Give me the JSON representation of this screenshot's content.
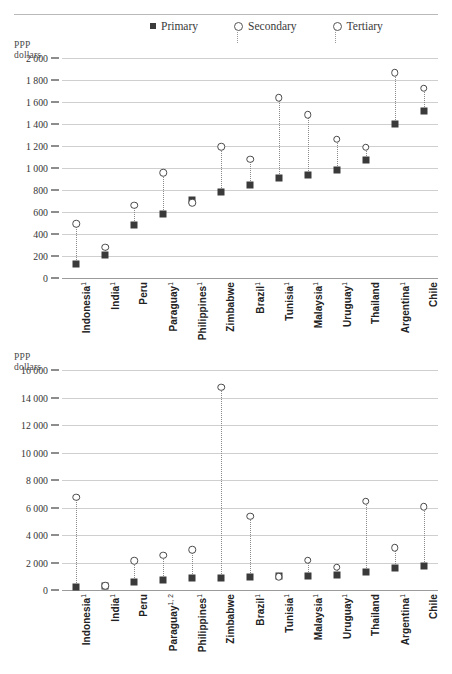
{
  "legend": {
    "items": [
      {
        "label": "Primary",
        "marker": "filled-square",
        "color": "#3c3c3c"
      },
      {
        "label": "Secondary",
        "marker": "open-circle",
        "color": "#555555"
      },
      {
        "label": "Tertiary",
        "marker": "open-circle",
        "color": "#555555"
      }
    ]
  },
  "chart_data": [
    {
      "id": "top",
      "type": "scatter",
      "title": "",
      "ylabel": "PPP dollars",
      "xlabel": "",
      "ylim": [
        0,
        2000
      ],
      "ytick_step": 200,
      "ytick_labels": [
        "0",
        "200",
        "400",
        "600",
        "800",
        "1 000",
        "1 200",
        "1 400",
        "1 600",
        "1 800",
        "2 000"
      ],
      "grid": true,
      "legend_position": "top-center",
      "categories": [
        "Indonesia¹",
        "India¹",
        "Peru",
        "Paraguay¹",
        "Philippines¹",
        "Zimbabwe",
        "Brazil¹",
        "Tunisia¹",
        "Malaysia¹",
        "Uruguay¹",
        "Thailand",
        "Argentina¹",
        "Chile"
      ],
      "series": [
        {
          "name": "Primary",
          "marker": "filled-square",
          "values": [
            130,
            210,
            480,
            580,
            710,
            780,
            845,
            905,
            940,
            985,
            1070,
            1400,
            1520
          ]
        },
        {
          "name": "Secondary",
          "marker": "open-circle",
          "values": [
            500,
            285,
            665,
            960,
            690,
            1200,
            1085,
            1645,
            1490,
            1265,
            1195,
            1870,
            1730
          ]
        }
      ]
    },
    {
      "id": "bottom",
      "type": "scatter",
      "title": "",
      "ylabel": "PPP dollars",
      "xlabel": "",
      "ylim": [
        0,
        16000
      ],
      "ytick_step": 2000,
      "ytick_labels": [
        "0",
        "2 000",
        "4 000",
        "6 000",
        "8 000",
        "10 000",
        "12 000",
        "14 000",
        "16 000"
      ],
      "grid": true,
      "legend_position": "none",
      "categories": [
        "Indonesia¹",
        "India¹",
        "Peru",
        "Paraguay¹'²",
        "Philippines¹",
        "Zimbabwe",
        "Brazil¹",
        "Tunisia¹",
        "Malaysia¹",
        "Uruguay¹",
        "Thailand",
        "Argentina¹",
        "Chile"
      ],
      "series": [
        {
          "name": "Primary",
          "marker": "filled-square",
          "values": [
            200,
            300,
            600,
            700,
            850,
            900,
            950,
            1000,
            1050,
            1100,
            1300,
            1600,
            1750
          ]
        },
        {
          "name": "Tertiary",
          "marker": "open-circle",
          "values": [
            6800,
            350,
            2150,
            2550,
            2950,
            14800,
            5400,
            1000,
            2200,
            1700,
            6500,
            3100,
            6100
          ]
        }
      ]
    }
  ]
}
